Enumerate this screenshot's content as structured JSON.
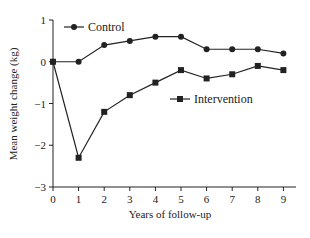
{
  "chart_data": {
    "type": "line",
    "title": "",
    "xlabel": "Years of follow-up",
    "ylabel": "Mean weight change (kg)",
    "x": [
      0,
      1,
      2,
      3,
      4,
      5,
      6,
      7,
      8,
      9
    ],
    "xticks": [
      "0",
      "1",
      "2",
      "3",
      "4",
      "5",
      "6",
      "7",
      "8",
      "9"
    ],
    "yticks": [
      "1",
      "0",
      "−1",
      "−2",
      "−3"
    ],
    "xlim": [
      0,
      9.5
    ],
    "ylim": [
      -3,
      1
    ],
    "grid": false,
    "legend_position": "inline",
    "series": [
      {
        "name": "Control",
        "marker": "circle",
        "values": [
          0,
          0,
          0.4,
          0.5,
          0.6,
          0.6,
          0.3,
          0.3,
          0.3,
          0.2
        ]
      },
      {
        "name": "Intervention",
        "marker": "square",
        "values": [
          0,
          -2.3,
          -1.2,
          -0.8,
          -0.5,
          -0.2,
          -0.4,
          -0.3,
          -0.1,
          -0.2
        ]
      }
    ]
  },
  "colors": {
    "line": "#222222",
    "background": "#ffffff"
  }
}
